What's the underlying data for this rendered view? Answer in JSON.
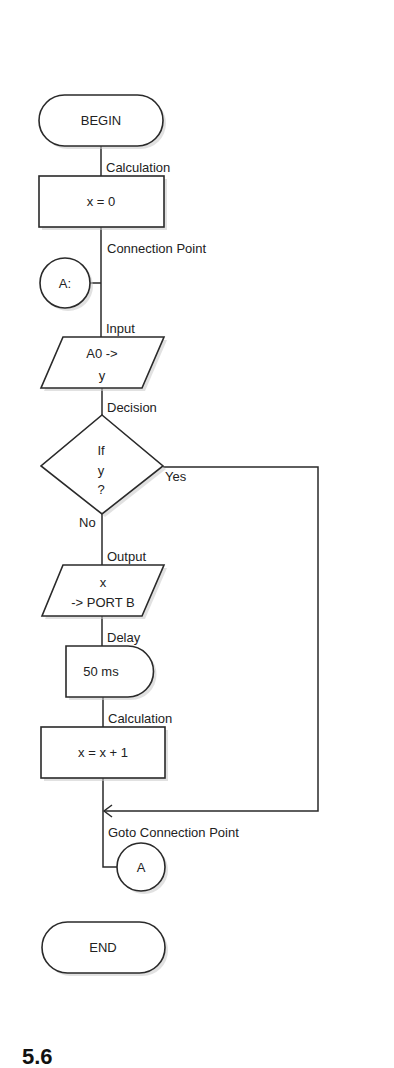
{
  "diagram": {
    "type": "flowchart",
    "nodes": {
      "begin": {
        "kind": "terminal",
        "text": "BEGIN"
      },
      "calc1": {
        "kind": "process",
        "label": "Calculation",
        "text": "x = 0"
      },
      "conn": {
        "kind": "connector",
        "label": "Connection Point",
        "text": "A:"
      },
      "input": {
        "kind": "io",
        "label": "Input",
        "line1": "A0 ->",
        "line2": "y"
      },
      "decision": {
        "kind": "decision",
        "label": "Decision",
        "line1": "If",
        "line2": "y",
        "line3": "?",
        "yes": "Yes",
        "no": "No"
      },
      "output": {
        "kind": "io",
        "label": "Output",
        "line1": "x",
        "line2": "-> PORT B"
      },
      "delay": {
        "kind": "delay",
        "label": "Delay",
        "text": "50 ms"
      },
      "calc2": {
        "kind": "process",
        "label": "Calculation",
        "text": "x = x + 1"
      },
      "goto": {
        "kind": "connector",
        "label": "Goto Connection Point",
        "text": "A"
      },
      "end": {
        "kind": "terminal",
        "text": "END"
      }
    },
    "edges": [
      {
        "from": "begin",
        "to": "calc1"
      },
      {
        "from": "calc1",
        "to": "conn"
      },
      {
        "from": "conn",
        "to": "input"
      },
      {
        "from": "input",
        "to": "decision"
      },
      {
        "from": "decision",
        "to": "output",
        "label": "No"
      },
      {
        "from": "decision",
        "to": "goto",
        "label": "Yes"
      },
      {
        "from": "output",
        "to": "delay"
      },
      {
        "from": "delay",
        "to": "calc2"
      },
      {
        "from": "calc2",
        "to": "goto"
      }
    ]
  },
  "page": {
    "cropped_fragment": "5.6"
  },
  "colors": {
    "stroke": "#2a2a2a",
    "fill": "#ffffff",
    "text": "#222222",
    "shadow": "#c9c9c9"
  }
}
